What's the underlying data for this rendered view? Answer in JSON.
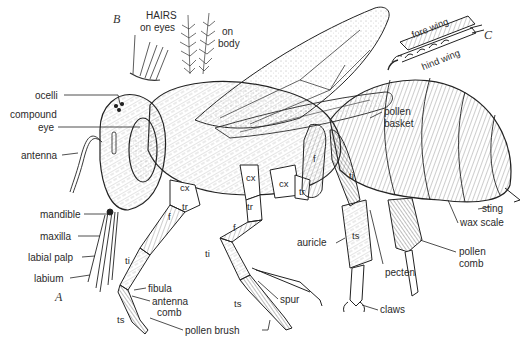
{
  "figure": {
    "panels": [
      {
        "id": "A",
        "letter": "A",
        "x": 55,
        "y": 298
      },
      {
        "id": "B",
        "letter": "B",
        "x": 113,
        "y": 18
      },
      {
        "id": "C",
        "letter": "C",
        "x": 484,
        "y": 30
      }
    ],
    "inset_B": {
      "title": "HAIRS",
      "eye_hairs_label": "on eyes",
      "body_hairs_label_line1": "on",
      "body_hairs_label_line2": "body"
    },
    "inset_C": {
      "fore_wing_label": "fore wing",
      "hind_wing_label": "hind wing"
    },
    "labels_left": [
      {
        "name": "ocelli",
        "text": "ocelli",
        "x": 35,
        "y": 89
      },
      {
        "name": "compound-eye-line1",
        "text": "compound",
        "x": 10,
        "y": 108
      },
      {
        "name": "compound-eye-line2",
        "text": "eye",
        "x": 38,
        "y": 121
      },
      {
        "name": "antenna",
        "text": "antenna",
        "x": 21,
        "y": 149
      },
      {
        "name": "mandible",
        "text": "mandible",
        "x": 40,
        "y": 209
      },
      {
        "name": "maxilla",
        "text": "maxilla",
        "x": 40,
        "y": 230
      },
      {
        "name": "labial-palp",
        "text": "labial palp",
        "x": 28,
        "y": 251
      },
      {
        "name": "labium",
        "text": "labium",
        "x": 34,
        "y": 272
      }
    ],
    "labels_bottom": [
      {
        "name": "fibula",
        "text": "fibula",
        "x": 148,
        "y": 283
      },
      {
        "name": "antenna-comb-line1",
        "text": "antenna",
        "x": 152,
        "y": 296
      },
      {
        "name": "antenna-comb-line2",
        "text": "comb",
        "x": 157,
        "y": 307
      },
      {
        "name": "pollen-brush",
        "text": "pollen brush",
        "x": 185,
        "y": 324
      },
      {
        "name": "spur",
        "text": "spur",
        "x": 280,
        "y": 294
      },
      {
        "name": "claws",
        "text": "claws",
        "x": 380,
        "y": 304
      },
      {
        "name": "auricle",
        "text": "auricle",
        "x": 297,
        "y": 237
      },
      {
        "name": "pecten",
        "text": "pecten",
        "x": 385,
        "y": 267
      }
    ],
    "labels_right": [
      {
        "name": "pollen-basket-line1",
        "text": "pollen",
        "x": 384,
        "y": 109
      },
      {
        "name": "pollen-basket-line2",
        "text": "basket",
        "x": 384,
        "y": 121
      },
      {
        "name": "sting",
        "text": "sting",
        "x": 482,
        "y": 203
      },
      {
        "name": "wax-scale",
        "text": "wax scale",
        "x": 460,
        "y": 217
      },
      {
        "name": "pollen-comb-line1",
        "text": "pollen",
        "x": 459,
        "y": 246
      },
      {
        "name": "pollen-comb-line2",
        "text": "comb",
        "x": 459,
        "y": 258
      }
    ],
    "segment_labels": [
      {
        "name": "coxa-front",
        "text": "cx",
        "x": 180,
        "y": 187
      },
      {
        "name": "trochanter-front",
        "text": "tr",
        "x": 182,
        "y": 206
      },
      {
        "name": "femur-front",
        "text": "f",
        "x": 168,
        "y": 216
      },
      {
        "name": "tibia-front",
        "text": "ti",
        "x": 125,
        "y": 256
      },
      {
        "name": "tarsus-front",
        "text": "ts",
        "x": 117,
        "y": 315
      },
      {
        "name": "coxa-mid",
        "text": "cx",
        "x": 246,
        "y": 175
      },
      {
        "name": "trochanter-mid",
        "text": "tr",
        "x": 247,
        "y": 203
      },
      {
        "name": "femur-mid",
        "text": "f",
        "x": 233,
        "y": 223
      },
      {
        "name": "tibia-mid",
        "text": "ti",
        "x": 205,
        "y": 249
      },
      {
        "name": "tarsus-mid",
        "text": "ts",
        "x": 234,
        "y": 300
      },
      {
        "name": "coxa-hind",
        "text": "cx",
        "x": 279,
        "y": 181
      },
      {
        "name": "trochanter-hind",
        "text": "tr",
        "x": 299,
        "y": 188
      },
      {
        "name": "femur-hind",
        "text": "f",
        "x": 313,
        "y": 157
      },
      {
        "name": "tibia-hind",
        "text": "ti",
        "x": 349,
        "y": 172
      },
      {
        "name": "tarsus-hind",
        "text": "ts",
        "x": 352,
        "y": 232
      }
    ]
  }
}
